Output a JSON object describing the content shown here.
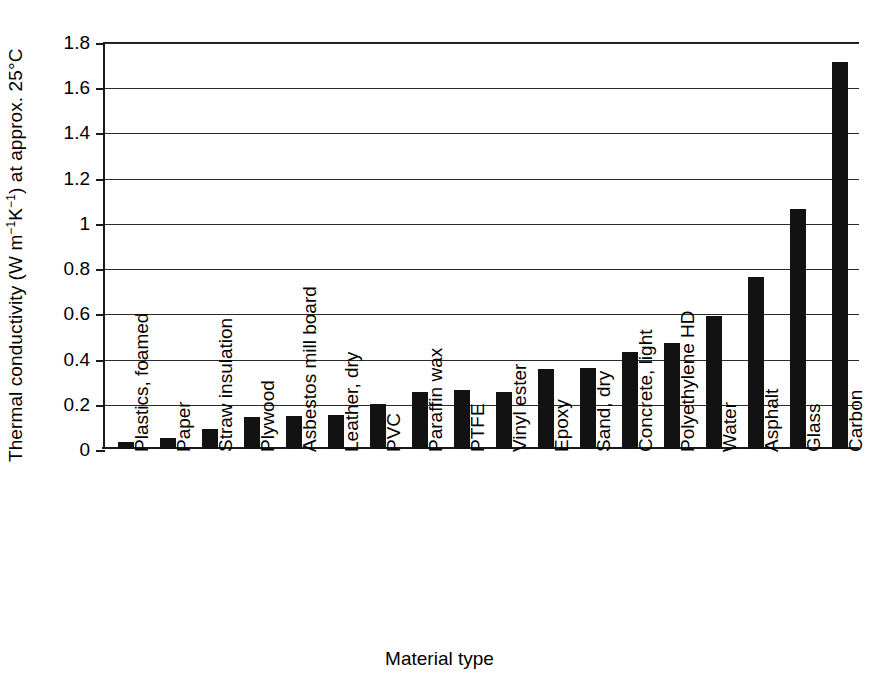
{
  "chart_data": {
    "type": "bar",
    "title": "",
    "xlabel": "Material type",
    "ylabel": "Thermal conductivity (W m−1K−1) at approx. 25°C",
    "ylabel_parts": {
      "prefix": "Thermal conductivity (W m",
      "sup1": "−1",
      "mid": "K",
      "sup2": "−1",
      "suffix": ") at approx. 25°C"
    },
    "categories": [
      "Plastics, foamed",
      "Paper",
      "Straw insulation",
      "Plywood",
      "Asbestos mill board",
      "Leather, dry",
      "PVC",
      "Paraffin wax",
      "PTFE",
      "Vinyl ester",
      "Epoxy",
      "Sand, dry",
      "Concrete, light",
      "Polyethylene HD",
      "Water",
      "Asphalt",
      "Glass",
      "Carbon"
    ],
    "values": [
      0.03,
      0.05,
      0.09,
      0.14,
      0.145,
      0.15,
      0.2,
      0.25,
      0.26,
      0.25,
      0.355,
      0.36,
      0.43,
      0.47,
      0.59,
      0.76,
      1.06,
      1.71
    ],
    "ylim": [
      0,
      1.8
    ],
    "ytick_labels": [
      "0",
      "0.2",
      "0.4",
      "0.6",
      "0.8",
      "1",
      "1.2",
      "1.4",
      "1.6",
      "1.8"
    ],
    "ytick_values": [
      0,
      0.2,
      0.4,
      0.6,
      0.8,
      1.0,
      1.2,
      1.4,
      1.6,
      1.8
    ],
    "grid": true,
    "legend": false,
    "bar_color": "#121212",
    "axis_color": "#1a1a1a"
  }
}
